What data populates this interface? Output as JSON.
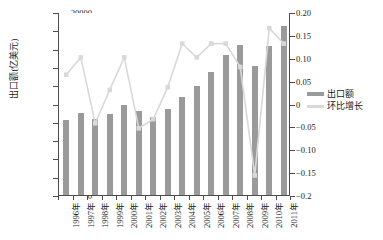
{
  "chart_data": {
    "type": "bar",
    "title": "",
    "subtitle": "",
    "xlabel": "",
    "ylabel": "出口额(亿美元)",
    "ylabel_right": "",
    "categories": [
      "1996年",
      "1997年",
      "1998年",
      "1999年",
      "2000年",
      "2001年",
      "2002年",
      "2003年",
      "2004年",
      "2005年",
      "2006年",
      "2007年",
      "2008年",
      "2009年",
      "2010年",
      "2011年"
    ],
    "ylim": [
      0,
      20000
    ],
    "ylim_right": [
      -0.2,
      0.2
    ],
    "yticks": [
      "0",
      "2000",
      "4000",
      "6000",
      "8000",
      "10000",
      "12000",
      "14000",
      "16000",
      "18000",
      "20000"
    ],
    "yticks_right": [
      "-0.2",
      "-0.15",
      "-0.10",
      "-0.05",
      "0",
      "0.05",
      "0.10",
      "0.15",
      "0.20"
    ],
    "grid": false,
    "legend_position": "right",
    "series": [
      {
        "name": "出口额",
        "type": "bar",
        "axis": "left",
        "color": "#9a9a9a",
        "values": [
          8150,
          8980,
          8300,
          8900,
          9800,
          9200,
          8500,
          9400,
          10700,
          11900,
          13450,
          15300,
          16400,
          14050,
          16300,
          18500
        ]
      },
      {
        "name": "环比增长",
        "type": "line",
        "axis": "right",
        "color": "#d9d9d9",
        "values": [
          0.065,
          0.103,
          -0.041,
          0.032,
          0.103,
          -0.052,
          -0.032,
          0.038,
          0.133,
          0.103,
          0.133,
          0.133,
          0.082,
          -0.155,
          0.167,
          0.133
        ]
      }
    ]
  },
  "legend": {
    "items": [
      {
        "label": "出口额",
        "color": "#9a9a9a",
        "swatch": "bar-swatch"
      },
      {
        "label": "环比增长",
        "color": "#d9d9d9",
        "swatch": "line-swatch"
      }
    ]
  }
}
